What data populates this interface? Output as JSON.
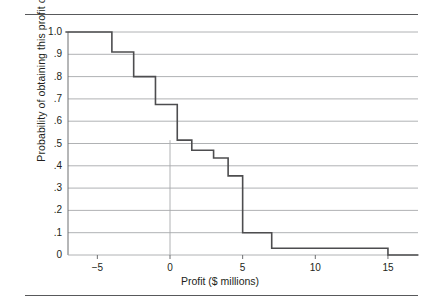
{
  "figure": {
    "top_rule": "divider-top",
    "bottom_rule": "divider-bottom"
  },
  "chart_data": {
    "type": "line",
    "subtype": "step-decreasing-cumulative",
    "title": "",
    "xlabel": "Profit ($ millions)",
    "ylabel": "Probability of obtaining this profit or more",
    "xlim": [
      -7.2,
      17.1
    ],
    "ylim": [
      0,
      1.0
    ],
    "grid": "horizontal",
    "legend": "none",
    "xticks": [
      -5,
      0,
      5,
      10,
      15
    ],
    "xtick_labels": [
      "−5",
      "0",
      "5",
      "10",
      "15"
    ],
    "yticks": [
      0,
      0.1,
      0.2,
      0.3,
      0.4,
      0.5,
      0.6,
      0.7,
      0.8,
      0.9,
      1.0
    ],
    "ytick_labels": [
      "0",
      ".1",
      ".2",
      ".3",
      ".4",
      ".5",
      ".6",
      ".7",
      ".8",
      ".9",
      "1.0"
    ],
    "series": [
      {
        "name": "Cumulative probability of profit or more",
        "color": "#4d4d4f",
        "steps": [
          {
            "x_start": -7.2,
            "x_end": -4.0,
            "y": 1.0
          },
          {
            "x_start": -4.0,
            "x_end": -2.5,
            "y": 0.91
          },
          {
            "x_start": -2.5,
            "x_end": -1.0,
            "y": 0.8
          },
          {
            "x_start": -1.0,
            "x_end": 0.5,
            "y": 0.675
          },
          {
            "x_start": 0.5,
            "x_end": 1.5,
            "y": 0.515
          },
          {
            "x_start": 1.5,
            "x_end": 3.0,
            "y": 0.47
          },
          {
            "x_start": 3.0,
            "x_end": 4.0,
            "y": 0.435
          },
          {
            "x_start": 4.0,
            "x_end": 5.0,
            "y": 0.355
          },
          {
            "x_start": 5.0,
            "x_end": 7.0,
            "y": 0.1
          },
          {
            "x_start": 7.0,
            "x_end": 15.0,
            "y": 0.03
          },
          {
            "x_start": 15.0,
            "x_end": 17.1,
            "y": 0.0
          }
        ]
      }
    ],
    "reference_lines": [
      {
        "name": "zero-profit-line",
        "orientation": "vertical",
        "x": 0,
        "y_from": 0,
        "y_to": 0.515,
        "color": "#a7a9ac"
      }
    ]
  }
}
